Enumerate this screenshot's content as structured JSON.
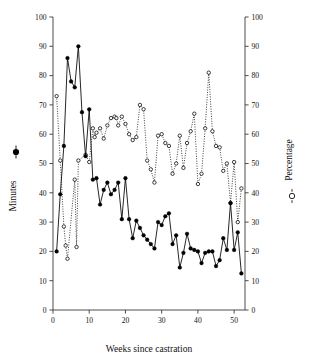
{
  "chart_data": {
    "type": "line",
    "title": "",
    "xlabel": "Weeks since castration",
    "ylabel": "Minutes",
    "ylabel_right": "Percentage",
    "xlim": [
      0,
      53
    ],
    "ylim": [
      0,
      100
    ],
    "ylim_right": [
      0,
      100
    ],
    "xticks": [
      0,
      10,
      20,
      30,
      40,
      50
    ],
    "yticks": [
      0,
      10,
      20,
      30,
      40,
      50,
      60,
      70,
      80,
      90,
      100
    ],
    "yticks_right": [
      0,
      10,
      20,
      30,
      40,
      50,
      60,
      70,
      80,
      90,
      100
    ],
    "grid": false,
    "legend": "axis-symbols",
    "series": [
      {
        "name": "Minutes",
        "axis": "left",
        "marker": "filled-circle",
        "linestyle": "solid",
        "color": "#000000",
        "x": [
          1,
          2,
          3,
          4,
          5,
          6,
          7,
          8,
          9,
          10,
          11,
          12,
          13,
          14,
          15,
          16,
          17,
          18,
          19,
          20,
          21,
          22,
          23,
          24,
          25,
          26,
          27,
          28,
          29,
          30,
          31,
          32,
          33,
          34,
          35,
          36,
          37,
          38,
          39,
          40,
          41,
          42,
          43,
          44,
          45,
          46,
          47,
          48,
          49,
          50,
          51,
          52
        ],
        "y": [
          20,
          39.5,
          56,
          86,
          78,
          76,
          90,
          67.5,
          52.5,
          68.5,
          44.5,
          45,
          36,
          41,
          43.5,
          39.5,
          41,
          43.5,
          31,
          45,
          31,
          24.5,
          30.5,
          28,
          25.5,
          24,
          22.5,
          21,
          30,
          29,
          32,
          33,
          22.5,
          25.5,
          14.5,
          19.5,
          26,
          21,
          20.5,
          20,
          16,
          19.5,
          20,
          20,
          15,
          17,
          24.5,
          20.5,
          36.5,
          20.5,
          26.5,
          12.5
        ]
      },
      {
        "name": "Percentage",
        "axis": "right",
        "marker": "open-circle",
        "linestyle": "dotted",
        "color": "#000000",
        "x": [
          1,
          2,
          3,
          3.5,
          4,
          6,
          6.5,
          7,
          9,
          10,
          11,
          11.5,
          12,
          13,
          14,
          15,
          16,
          17,
          17.5,
          18,
          19,
          20,
          21,
          22,
          23,
          24,
          25,
          26,
          27,
          28,
          29,
          30,
          31,
          32,
          33,
          34,
          35,
          36,
          37,
          38,
          39,
          40,
          41,
          42,
          43,
          44,
          45,
          46,
          47,
          48,
          49,
          50,
          51,
          52
        ],
        "y": [
          73,
          51,
          28.5,
          22,
          17.5,
          44.5,
          21.5,
          51,
          53,
          50.5,
          62,
          59,
          60.5,
          62,
          58.5,
          63,
          65.5,
          66,
          65.5,
          63,
          66,
          63.5,
          60,
          58,
          59,
          70,
          68.5,
          51,
          48,
          43.5,
          59.5,
          60,
          57,
          56,
          46.5,
          50,
          59.5,
          48.5,
          57,
          61,
          67,
          43,
          46.5,
          62,
          81,
          61,
          56,
          55.5,
          47.5,
          50,
          36.5,
          50.5,
          30,
          41.5
        ]
      }
    ]
  },
  "labels": {
    "left_axis_symbol": "filled-circle-marker",
    "right_axis_symbol": "open-circle-marker"
  }
}
